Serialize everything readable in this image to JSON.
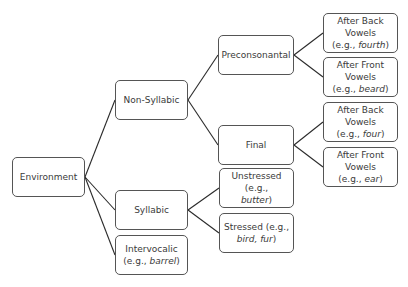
{
  "diagram": {
    "type": "tree",
    "root": "environment",
    "colors": {
      "line": "#2a2a2a",
      "border": "#555555",
      "text": "#3a3a3a",
      "background": "#ffffff"
    },
    "nodes": {
      "environment": {
        "label": "Environment",
        "box": [
          12,
          157,
          73,
          40
        ]
      },
      "non_syllabic": {
        "label": "Non-Syllabic",
        "box": [
          115,
          80,
          73,
          40
        ]
      },
      "syllabic": {
        "label": "Syllabic",
        "box": [
          115,
          190,
          73,
          40
        ]
      },
      "intervocalic": {
        "label": "Intervocalic",
        "example_prefix": "(e.g., ",
        "example": "barrel",
        "example_suffix": ")",
        "box": [
          115,
          235,
          73,
          40
        ]
      },
      "preconsonantal": {
        "label": "Preconsonantal",
        "box": [
          218,
          35,
          76,
          40
        ]
      },
      "final": {
        "label": "Final",
        "box": [
          218,
          125,
          76,
          40
        ]
      },
      "unstressed": {
        "label": "Unstressed (e.g.,",
        "example": "butter",
        "example_suffix": ")",
        "box": [
          219,
          168,
          75,
          40
        ]
      },
      "stressed": {
        "label": "Stressed (e.g.,",
        "example": "bird, fur",
        "example_suffix": ")",
        "box": [
          219,
          213,
          75,
          40
        ]
      },
      "pre_back": {
        "label_line1": "After Back",
        "label_line2": "Vowels",
        "example_prefix": "(e.g., ",
        "example": "fourth",
        "example_suffix": ")",
        "box": [
          323,
          13,
          75,
          40
        ]
      },
      "pre_front": {
        "label_line1": "After Front",
        "label_line2": "Vowels",
        "example_prefix": "(e.g., ",
        "example": "beard",
        "example_suffix": ")",
        "box": [
          323,
          57,
          75,
          40
        ]
      },
      "final_back": {
        "label_line1": "After Back",
        "label_line2": "Vowels",
        "example_prefix": "(e.g., ",
        "example": "four",
        "example_suffix": ")",
        "box": [
          323,
          102,
          75,
          40
        ]
      },
      "final_front": {
        "label_line1": "After Front",
        "label_line2": "Vowels",
        "example_prefix": "(e.g., ",
        "example": "ear",
        "example_suffix": ")",
        "box": [
          323,
          147,
          75,
          40
        ]
      }
    },
    "edges": [
      [
        "environment",
        "non_syllabic"
      ],
      [
        "environment",
        "syllabic"
      ],
      [
        "environment",
        "intervocalic"
      ],
      [
        "non_syllabic",
        "preconsonantal"
      ],
      [
        "non_syllabic",
        "final"
      ],
      [
        "syllabic",
        "unstressed"
      ],
      [
        "syllabic",
        "stressed"
      ],
      [
        "preconsonantal",
        "pre_back"
      ],
      [
        "preconsonantal",
        "pre_front"
      ],
      [
        "final",
        "final_back"
      ],
      [
        "final",
        "final_front"
      ]
    ]
  }
}
